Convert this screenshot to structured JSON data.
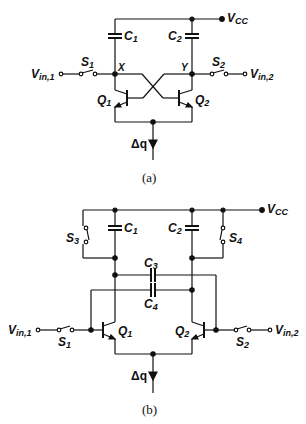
{
  "figure_a": {
    "caption": "(a)",
    "labels": {
      "vcc": "V",
      "vcc_sub": "CC",
      "c1": "C",
      "c1_sub": "1",
      "c2": "C",
      "c2_sub": "2",
      "s1": "S",
      "s1_sub": "1",
      "s2": "S",
      "s2_sub": "2",
      "x": "X",
      "y": "Y",
      "q1": "Q",
      "q1_sub": "1",
      "q2": "Q",
      "q2_sub": "2",
      "vin1": "V",
      "vin1_sub": "in,1",
      "vin2": "V",
      "vin2_sub": "in,2",
      "dq": "Δq"
    }
  },
  "figure_b": {
    "caption": "(b)",
    "labels": {
      "vcc": "V",
      "vcc_sub": "CC",
      "c1": "C",
      "c1_sub": "1",
      "c2": "C",
      "c2_sub": "2",
      "c3": "C",
      "c3_sub": "3",
      "c4": "C",
      "c4_sub": "4",
      "s1": "S",
      "s1_sub": "1",
      "s2": "S",
      "s2_sub": "2",
      "s3": "S",
      "s3_sub": "3",
      "s4": "S",
      "s4_sub": "4",
      "q1": "Q",
      "q1_sub": "1",
      "q2": "Q",
      "q2_sub": "2",
      "vin1": "V",
      "vin1_sub": "in,1",
      "vin2": "V",
      "vin2_sub": "in,2",
      "dq": "Δq"
    }
  }
}
